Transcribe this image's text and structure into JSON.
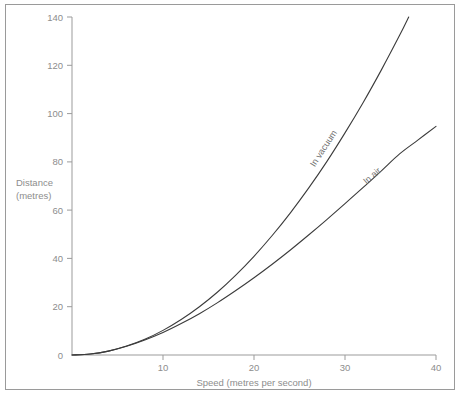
{
  "chart_data": {
    "type": "line",
    "title": "",
    "xlabel": "Speed (metres per second)",
    "ylabel": "Distance (metres)",
    "ylabel_line1": "Distance",
    "ylabel_line2": "(metres)",
    "xlim": [
      0,
      40
    ],
    "ylim": [
      0,
      140
    ],
    "xticks": [
      0,
      10,
      20,
      30,
      40
    ],
    "xticklabels": [
      "0",
      "10",
      "20",
      "30",
      "40"
    ],
    "yticks": [
      0,
      20,
      40,
      60,
      80,
      100,
      120,
      140
    ],
    "yticklabels": [
      "0",
      "20",
      "40",
      "60",
      "80",
      "100",
      "120",
      "140"
    ],
    "grid": false,
    "legend_position": "inline-curve-labels",
    "series": [
      {
        "name": "In vacuum",
        "label": "In vacuum",
        "color": "#3b3b3b",
        "x": [
          0,
          2,
          4,
          6,
          8,
          10,
          12,
          14,
          16,
          18,
          20,
          22,
          24,
          26,
          28,
          30,
          32,
          34,
          36,
          37
        ],
        "values": [
          0,
          0.4,
          1.6,
          3.7,
          6.5,
          10.2,
          14.7,
          20.0,
          26.1,
          33.1,
          40.9,
          49.5,
          58.9,
          69.1,
          80.1,
          92.0,
          104.6,
          118.1,
          132.4,
          140.0
        ]
      },
      {
        "name": "In air",
        "label": "In air",
        "color": "#3b3b3b",
        "x": [
          0,
          2,
          4,
          6,
          8,
          10,
          12,
          14,
          16,
          18,
          20,
          22,
          24,
          26,
          28,
          30,
          32,
          34,
          36,
          38,
          40
        ],
        "values": [
          0,
          0.4,
          1.6,
          3.6,
          6.2,
          9.3,
          13.0,
          17.1,
          21.7,
          26.7,
          32.0,
          37.6,
          43.5,
          49.7,
          56.1,
          62.7,
          69.4,
          76.3,
          83.3,
          89.0,
          94.7
        ]
      }
    ]
  },
  "axis": {
    "x_title": "Speed (metres per second)",
    "y_title_line1": "Distance",
    "y_title_line2": "(metres)"
  },
  "ticks": {
    "y140": "140",
    "y120": "120",
    "y100": "100",
    "y80": "80",
    "y60": "60",
    "y40": "40",
    "y20": "20",
    "y0": "0",
    "x10": "10",
    "x20": "20",
    "x30": "30",
    "x40": "40"
  },
  "labels": {
    "vacuum": "In vacuum",
    "air": "In air"
  },
  "colors": {
    "curve": "#3b3b3b",
    "axis": "#9b9b9b",
    "text": "#8d8d8d",
    "frame": "#9a9a9a",
    "background": "#ffffff"
  }
}
